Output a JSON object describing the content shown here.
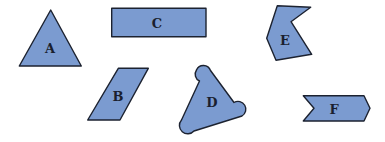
{
  "figure": {
    "background": "#ffffff",
    "fill_color": "#7b9bd0",
    "stroke_color": "#1c2230",
    "shapes": [
      {
        "id": "A",
        "label": "A",
        "type": "triangle"
      },
      {
        "id": "B",
        "label": "B",
        "type": "parallelogram"
      },
      {
        "id": "C",
        "label": "C",
        "type": "rectangle"
      },
      {
        "id": "D",
        "label": "D",
        "type": "rounded-triangle"
      },
      {
        "id": "E",
        "label": "E",
        "type": "concave-hexagon"
      },
      {
        "id": "F",
        "label": "F",
        "type": "chevron-arrow"
      }
    ]
  }
}
